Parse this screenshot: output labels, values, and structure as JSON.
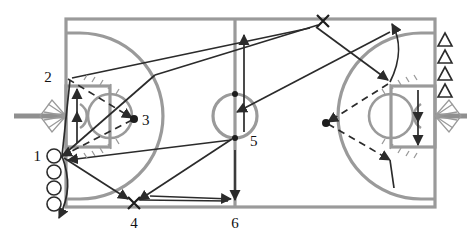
{
  "diagram": {
    "court_line_color": "#9a9a9a",
    "movement_line_color": "#2b2b2b",
    "background_color": "#ffffff",
    "marker_color": "#1d1d1d"
  },
  "labels": {
    "one": "1",
    "two": "2",
    "three": "3",
    "four": "4",
    "five": "5",
    "six": "6"
  },
  "markers": {
    "x_bottom": "X",
    "x_top": "X"
  },
  "legend": {
    "player_queue_label": "1",
    "player_queue_count": 4,
    "cone_count": 4,
    "ball_dot_left_label": "3",
    "ball_dot_right": ""
  }
}
